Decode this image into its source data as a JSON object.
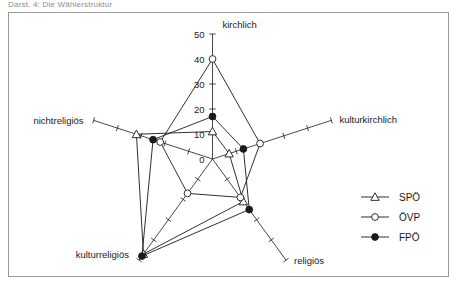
{
  "caption": "Darst. 4: Die Wählerstruktur",
  "chart_data": {
    "type": "radar",
    "title": "",
    "xlabel": "",
    "ylabel": "",
    "axes": [
      {
        "name": "kirchlich",
        "angle_deg": 90,
        "label": "kirchlich"
      },
      {
        "name": "kulturkirchlich",
        "angle_deg": 18,
        "label": "kulturkirchlich"
      },
      {
        "name": "religioes",
        "angle_deg": -54,
        "label": "religiös"
      },
      {
        "name": "kulturreligioes",
        "angle_deg": -126,
        "label": "kulturreligiös"
      },
      {
        "name": "nichtreligioes",
        "angle_deg": 162,
        "label": "nichtreligiös"
      }
    ],
    "radial_ticks": [
      0,
      10,
      20,
      30,
      40,
      50
    ],
    "radial_tick_labels": [
      "0",
      "10",
      "20",
      "30",
      "40",
      "50"
    ],
    "rlim": [
      0,
      50
    ],
    "grid": false,
    "legend_position": "right",
    "series": [
      {
        "name": "SPÖ",
        "marker": "open-triangle",
        "values": [
          11,
          7,
          21,
          47,
          32
        ]
      },
      {
        "name": "ÖVP",
        "marker": "open-circle",
        "values": [
          40,
          20,
          19,
          17,
          22
        ]
      },
      {
        "name": "FPÖ",
        "marker": "filled-circle",
        "values": [
          17,
          13,
          25,
          48,
          25
        ]
      }
    ]
  },
  "legend": {
    "items": [
      {
        "label": "SPÖ",
        "marker": "open-triangle"
      },
      {
        "label": "ÖVP",
        "marker": "open-circle"
      },
      {
        "label": "FPÖ",
        "marker": "filled-circle"
      }
    ]
  },
  "colors": {
    "line": "#1a1a1a",
    "frame": "#9a9a9a",
    "background": "#ffffff",
    "caption": "#8d8d8d"
  }
}
